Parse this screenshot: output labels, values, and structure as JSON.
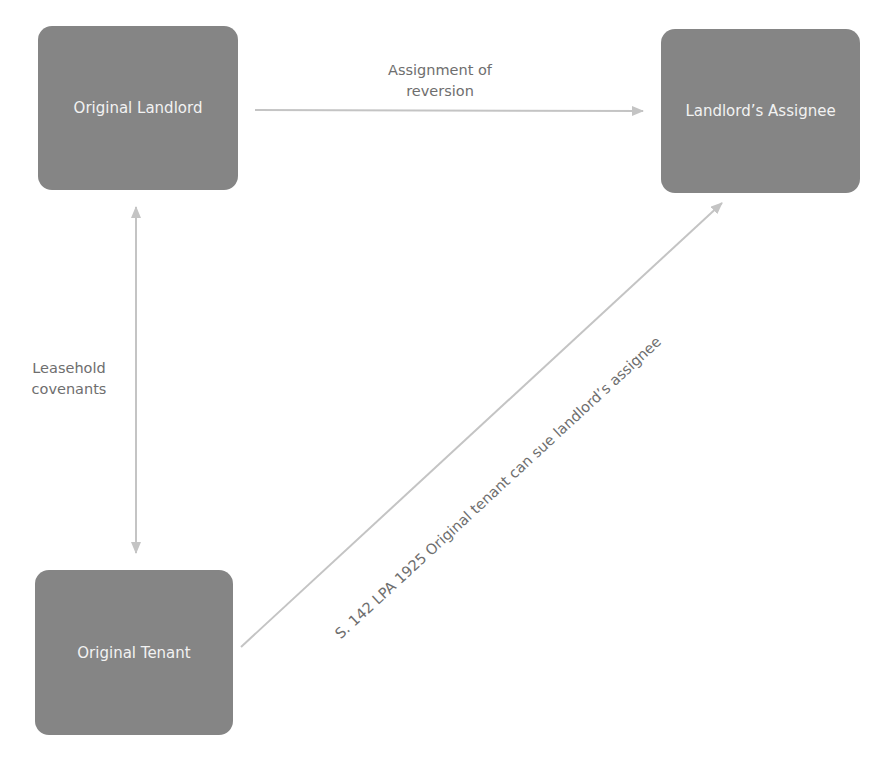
{
  "diagram": {
    "nodes": [
      {
        "id": "original-landlord",
        "label": "Original Landlord"
      },
      {
        "id": "landlords-assignee",
        "label": "Landlord’s Assignee"
      },
      {
        "id": "original-tenant",
        "label": "Original Tenant"
      }
    ],
    "edges": [
      {
        "from": "original-landlord",
        "to": "landlords-assignee",
        "label_line1": "Assignment of",
        "label_line2": "reversion",
        "direction": "forward"
      },
      {
        "from": "original-landlord",
        "to": "original-tenant",
        "label_line1": "Leasehold",
        "label_line2": "covenants",
        "direction": "both"
      },
      {
        "from": "original-tenant",
        "to": "landlords-assignee",
        "label": "S. 142 LPA 1925 Original tenant can sue landlord’s assignee",
        "direction": "forward"
      }
    ],
    "colors": {
      "node_fill": "#858585",
      "node_text": "#f2f2f2",
      "edge": "#c4c4c4",
      "label": "#6e6e6e"
    }
  }
}
